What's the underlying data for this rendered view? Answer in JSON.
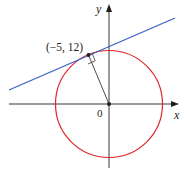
{
  "diagram": {
    "type": "tangent-line-to-circle",
    "axes": {
      "x_label": "x",
      "y_label": "y",
      "origin_label": "0",
      "color": "#231f20"
    },
    "circle": {
      "center": [
        0,
        0
      ],
      "radius": 13,
      "color": "#e0262b"
    },
    "point": {
      "label": "(−5, 12)",
      "coords": [
        -5,
        12
      ]
    },
    "tangent_line": {
      "color": "#3a62c4"
    },
    "radius_segment": {
      "from": [
        0,
        0
      ],
      "to": [
        -5,
        12
      ],
      "right_angle_marker": true
    }
  }
}
